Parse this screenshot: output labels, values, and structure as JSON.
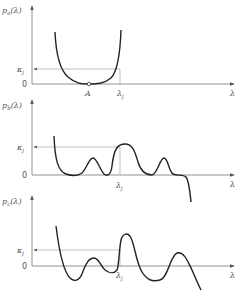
{
  "panels": [
    {
      "id": "a",
      "ylabel": "pₐ(λ)",
      "xlabel": "λ",
      "kappa_label": "κⱼ",
      "zero_label": "0",
      "marks": [
        {
          "label": "A",
          "note": "open circle at minimum"
        },
        {
          "label": "λⱼ"
        }
      ],
      "shape": "U-shaped polynomial, zero at A, rising steeply on both sides; crosses κⱼ at λⱼ"
    },
    {
      "id": "b",
      "ylabel": "p_b(λ)",
      "xlabel": "λ",
      "kappa_label": "κⱼ",
      "zero_label": "0",
      "marks": [
        {
          "label": "λⱼ"
        }
      ],
      "shape": "non-negative oscillating polynomial with three humps, largest near λⱼ reaching κⱼ, then plunging below zero"
    },
    {
      "id": "c",
      "ylabel": "p_c(λ)",
      "xlabel": "λ",
      "kappa_label": "κⱼ",
      "zero_label": "0",
      "marks": [
        {
          "label": "λⱼ"
        }
      ],
      "shape": "oscillating polynomial crossing zero several times, tall peak just after λⱼ"
    }
  ],
  "text": {
    "pa": "p",
    "pa_sub": "a",
    "pb": "p",
    "pb_sub": "b",
    "pc": "p",
    "pc_sub": "c",
    "arg": "(λ)",
    "lambda": "λ",
    "kappa": "κ",
    "j": "j",
    "zero": "0",
    "A": "A"
  }
}
